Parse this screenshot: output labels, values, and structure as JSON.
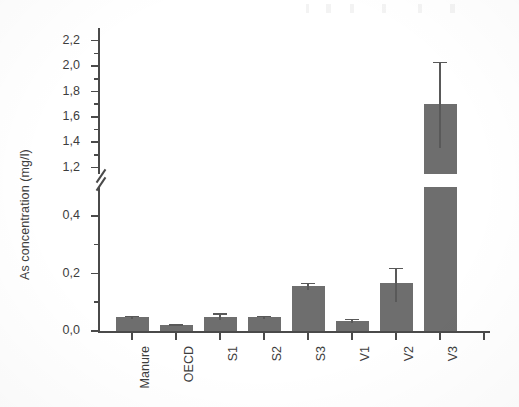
{
  "chart_data": {
    "type": "bar",
    "title": "",
    "subtitle": "",
    "xlabel": "",
    "ylabel": "As concentration (mg/l)",
    "categories": [
      "Manure",
      "OECD",
      "S1",
      "S2",
      "S3",
      "V1",
      "V2",
      "V3"
    ],
    "values": [
      0.047,
      0.02,
      0.05,
      0.048,
      0.155,
      0.035,
      0.165,
      1.7
    ],
    "errors_upper": [
      0.006,
      0.004,
      0.012,
      0.005,
      0.012,
      0.008,
      0.055,
      0.335
    ],
    "errors_lower": [
      0.006,
      0.004,
      0.012,
      0.005,
      0.012,
      0.008,
      0.065,
      0.345
    ],
    "series": [
      {
        "name": "As concentration",
        "values": [
          0.047,
          0.02,
          0.05,
          0.048,
          0.155,
          0.035,
          0.165,
          1.7
        ]
      }
    ],
    "broken_axis": true,
    "axis_segments": [
      {
        "name": "lower",
        "range": [
          0.0,
          0.5
        ],
        "ticks": [
          0.0,
          0.2,
          0.4
        ],
        "minor_ticks": [
          0.1,
          0.3
        ]
      },
      {
        "name": "upper",
        "range": [
          1.15,
          2.3
        ],
        "ticks": [
          1.2,
          1.4,
          1.6,
          1.8,
          2.0,
          2.2
        ],
        "minor_ticks": [
          1.3,
          1.5,
          1.7,
          1.9,
          2.1
        ]
      }
    ],
    "ytick_labels_lower": [
      "0,0",
      "0,2",
      "0,4"
    ],
    "ytick_labels_upper": [
      "1,2",
      "1,4",
      "1,6",
      "1,8",
      "2,0",
      "2,2"
    ],
    "grid": false,
    "legend": null,
    "colors": {
      "bar_fill": "#6e6e6e",
      "axis": "#4a4a4a",
      "error_bar": "#595959",
      "text": "#3d3d3d",
      "background": "#ffffff"
    }
  }
}
